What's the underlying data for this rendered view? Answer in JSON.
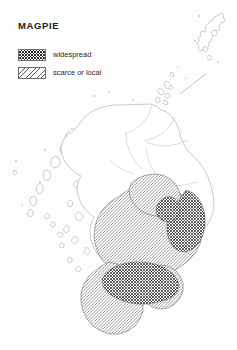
{
  "map": {
    "title": "MAGPIE",
    "region": "Scotland",
    "legend": {
      "items": [
        {
          "label": "widespread",
          "pattern": "cross-hatch",
          "color": "#2e2e2e"
        },
        {
          "label": "scarce or local",
          "pattern": "diagonal-hatch",
          "color": "#555555"
        }
      ]
    },
    "insets": [
      {
        "name": "Shetland",
        "position": "top-right"
      }
    ],
    "distribution": {
      "widespread_areas": [
        "Aberdeenshire coast",
        "Moray Firth coast",
        "Central Belt",
        "Clyde valley",
        "Lothians"
      ],
      "scarce_or_local_areas": [
        "Tayside",
        "Fife",
        "Ayrshire",
        "Dumfries and Galloway",
        "Scottish Borders",
        "Angus"
      ],
      "absent_areas": [
        "Outer Hebrides",
        "Skye",
        "Northwest Highlands",
        "Caithness",
        "Sutherland",
        "Orkney",
        "Shetland"
      ]
    },
    "background_color": "#fdfdfc",
    "coastline_color": "#8a8a8a"
  }
}
